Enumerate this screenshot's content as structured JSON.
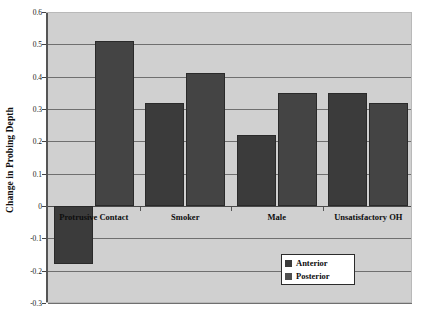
{
  "chart_data": {
    "type": "bar",
    "title": "",
    "xlabel": "",
    "ylabel": "Change in Probing Depth",
    "ylim": [
      -0.3,
      0.6
    ],
    "ystep": 0.1,
    "grid": true,
    "legend_position": "inside-bottom-right",
    "categories": [
      "Protrusive Contact",
      "Smoker",
      "Male",
      "Unsatisfactory OH"
    ],
    "series": [
      {
        "name": "Anterior",
        "color": "#3b3b3b",
        "values": [
          -0.18,
          0.32,
          0.22,
          0.35
        ]
      },
      {
        "name": "Posterior",
        "color": "#4f4f4f",
        "values": [
          0.51,
          0.41,
          0.35,
          0.32
        ]
      }
    ],
    "ytick_labels": [
      "0.6",
      "0.5",
      "0.4",
      "0.3",
      "0.2",
      "0.1",
      "0",
      "-0.1",
      "-0.2",
      "-0.3"
    ],
    "ytick_values": [
      0.6,
      0.5,
      0.4,
      0.3,
      0.2,
      0.1,
      0,
      -0.1,
      -0.2,
      -0.3
    ]
  },
  "legend": {
    "items": [
      {
        "label": "Anterior"
      },
      {
        "label": "Posterior"
      }
    ]
  },
  "axis": {
    "y_title": "Change in Probing Depth"
  },
  "colors": {
    "plot_background": "#d0d0d0",
    "anterior_bar": "#3b3b3b",
    "posterior_bar": "#4f4f4f",
    "gridline": "#6f6f6f",
    "axis_line": "#555555"
  }
}
